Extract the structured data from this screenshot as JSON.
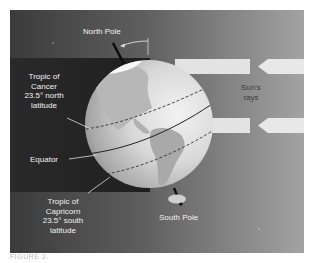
{
  "figure": {
    "labels": {
      "north_pole": "North Pole",
      "south_pole": "South Pole",
      "tropic_cancer": [
        "Tropic of",
        "Cancer",
        "23.5° north",
        "latitude"
      ],
      "equator": "Equator",
      "tropic_capricorn": [
        "Tropic of",
        "Capricorn",
        "23.5° south",
        "latitude"
      ],
      "sun_rays": [
        "Sun's",
        "rays"
      ]
    },
    "axial_tilt_degrees": 23.5,
    "caption_partial": "FIGURE 2-",
    "colors": {
      "background_left": "#3b3b3b",
      "background_right": "#a3a3a3",
      "night_band": "#262626",
      "ray_arrow": "#e6e6e6",
      "globe_light": "#e9e9e9",
      "globe_dark": "#8a8a8a",
      "land": "#b5b5b5",
      "axis": "#111111"
    }
  }
}
